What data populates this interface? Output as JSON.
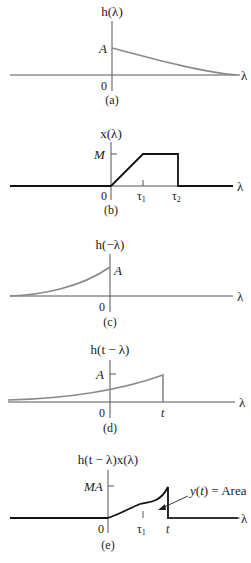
{
  "figure": {
    "panels": [
      {
        "id": "a",
        "caption": "(a)",
        "ylabel": "h(λ)",
        "xlabel": "λ",
        "origin": "0",
        "level_label": "A",
        "description": "Causal decaying exponential starting at A at λ=0"
      },
      {
        "id": "b",
        "caption": "(b)",
        "ylabel": "x(λ)",
        "xlabel": "λ",
        "origin": "0",
        "level_label": "M",
        "ticks": [
          "τ1",
          "τ2"
        ],
        "description": "Ramp from 0 to M on [0, τ1], constant M until τ2, then zero"
      },
      {
        "id": "c",
        "caption": "(c)",
        "ylabel": "h(−λ)",
        "xlabel": "λ",
        "origin": "0",
        "level_label": "A",
        "description": "Time-reversed exponential rising to A at λ=0"
      },
      {
        "id": "d",
        "caption": "(d)",
        "ylabel": "h(t − λ)",
        "xlabel": "λ",
        "origin": "0",
        "level_label": "A",
        "ticks": [
          "t"
        ],
        "description": "Reversed exponential shifted to end at λ=t with height A"
      },
      {
        "id": "e",
        "caption": "(e)",
        "ylabel": "h(t − λ)x(λ)",
        "xlabel": "λ",
        "origin": "0",
        "level_label": "MA",
        "ticks": [
          "τ1",
          "t"
        ],
        "annotation": "y(t) = Area",
        "description": "Product of shifted impulse response and input; area under curve equals y(t)"
      }
    ]
  },
  "labels": {
    "a": {
      "ylabel": "h(λ)",
      "A": "A",
      "zero": "0",
      "lambda": "λ",
      "caption": "(a)"
    },
    "b": {
      "ylabel": "x(λ)",
      "M": "M",
      "zero": "0",
      "lambda": "λ",
      "tau": "τ",
      "sub1": "1",
      "sub2": "2",
      "caption": "(b)"
    },
    "c": {
      "ylabel": "h(−λ)",
      "A": "A",
      "zero": "0",
      "lambda": "λ",
      "caption": "(c)"
    },
    "d": {
      "ylabel": "h(t − λ)",
      "A": "A",
      "zero": "0",
      "t": "t",
      "lambda": "λ",
      "caption": "(d)"
    },
    "e": {
      "ylabel": "h(t − λ)x(λ)",
      "MA": "MA",
      "zero": "0",
      "tau": "τ",
      "sub1": "1",
      "t": "t",
      "lambda": "λ",
      "area": "y(t) = Area",
      "caption": "(e)"
    }
  }
}
